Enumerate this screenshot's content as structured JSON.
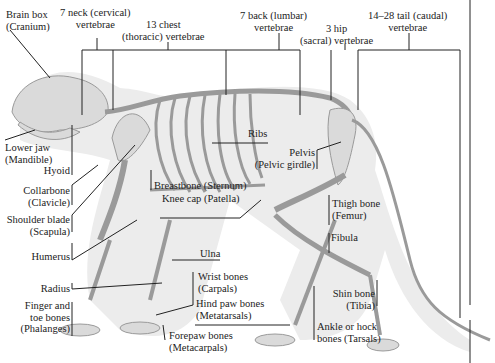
{
  "diagram": {
    "colors": {
      "silhouette": "#e9e9e9",
      "bone": "#d7d7d7",
      "bone_stroke": "#9a9a9a",
      "line": "#222222"
    },
    "vertebrae_labels": [
      {
        "line1": "7 neck (cervical)",
        "line2": "vertebrae"
      },
      {
        "line1": "13 chest",
        "line2": "(thoracic) vertebrae"
      },
      {
        "line1": "7 back (lumbar)",
        "line2": "vertebrae"
      },
      {
        "line1": "3 hip",
        "line2": "(sacral) vertebrae"
      },
      {
        "line1": "14–28 tail (caudal)",
        "line2": "vertebrae"
      }
    ],
    "labels": {
      "brain_box": {
        "line1": "Brain box",
        "line2": "(Cranium)"
      },
      "lower_jaw": {
        "line1": "Lower jaw",
        "line2": "(Mandible)"
      },
      "hyoid": "Hyoid",
      "collarbone": {
        "line1": "Collarbone",
        "line2": "(Clavicle)"
      },
      "shoulder_blade": {
        "line1": "Shoulder blade",
        "line2": "(Scapula)"
      },
      "humerus": "Humerus",
      "radius": "Radius",
      "phalanges": {
        "line1": "Finger and",
        "line2": "toe bones",
        "line3": "(Phalanges)"
      },
      "ribs": "Ribs",
      "breastbone": "Breastbone (Sternum)",
      "knee_cap": "Knee cap (Patella)",
      "pelvis": {
        "line1": "Pelvis",
        "line2": "(Pelvic girdle)"
      },
      "thigh_bone": {
        "line1": "Thigh bone",
        "line2": "(Femur)"
      },
      "fibula": "Fibula",
      "ulna": "Ulna",
      "wrist_bones": {
        "line1": "Wrist bones",
        "line2": "(Carpals)"
      },
      "hind_paw_bones": {
        "line1": "Hind paw bones",
        "line2": "(Metatarsals)"
      },
      "forepaw_bones": {
        "line1": "Forepaw bones",
        "line2": "(Metacarpals)"
      },
      "shin_bone": {
        "line1": "Shin bone",
        "line2": "(Tibia)"
      },
      "ankle_bones": {
        "line1": "Ankle or hock",
        "line2": "bones (Tarsals)"
      }
    }
  }
}
